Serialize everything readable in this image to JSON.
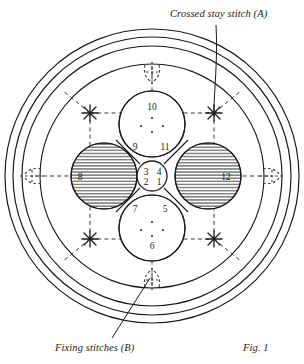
{
  "figure": {
    "caption": "Fig. 1",
    "annotations": [
      {
        "id": "crossed-stay-stitch",
        "text": "Crossed stay stitch (A)"
      },
      {
        "id": "fixing-stitches",
        "text": "Fixing stitches (B)"
      }
    ],
    "center_circle": {
      "top_left": "3",
      "top_right": "4",
      "bottom_left": "2",
      "bottom_right": "1"
    },
    "petal_labels": {
      "top": "10",
      "bottom": "6",
      "left": "8",
      "right": "12"
    },
    "quadrant_labels": {
      "upper_left": "9",
      "upper_right": "11",
      "lower_left": "7",
      "lower_right": "5"
    },
    "colors": {
      "ink": "#1a1a1a",
      "hatch": "#2b2b2b",
      "dashed": "#3a3a3a",
      "background": "#ffffff"
    },
    "rings": [
      {
        "name": "outer-ring",
        "r": 147
      },
      {
        "name": "middle-ring",
        "r": 139
      },
      {
        "name": "inner-ring",
        "r": 130
      },
      {
        "name": "field-ring",
        "r": 112
      }
    ]
  }
}
